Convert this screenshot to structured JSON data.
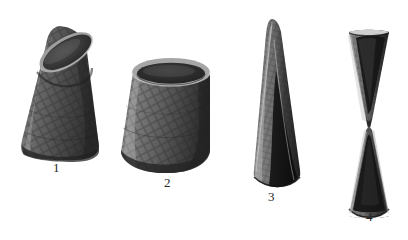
{
  "plate": {
    "title": "Conical woven vessels plate",
    "background_color": "#ffffff",
    "ink_color": "#262626",
    "medium": "halftone photographic plate",
    "object_count": 4
  },
  "labels": [
    {
      "id": "label-1",
      "text": "1",
      "x": 57,
      "y": 168
    },
    {
      "id": "label-2",
      "text": "2",
      "x": 168,
      "y": 183
    },
    {
      "id": "label-3",
      "text": "3",
      "x": 272,
      "y": 197
    },
    {
      "id": "label-4",
      "text": "4",
      "x": 370,
      "y": 217
    }
  ],
  "objects": [
    {
      "number": "1",
      "name": "truncated-cone-tilted",
      "description": "Wide truncated cone tilted left, open elliptical mouth at top, woven cross-hatch surface",
      "fill": "#5a5a5a",
      "shadow": "#2e2e2e",
      "highlight": "#9a9a9a",
      "mouth_fill": "#3a3a3a"
    },
    {
      "number": "2",
      "name": "truncated-cone-upright",
      "description": "Shorter, broader truncated cone upright with dark open mouth and thick rim",
      "fill": "#5f5f5f",
      "shadow": "#303030",
      "highlight": "#a2a2a2",
      "mouth_fill": "#2b2b2b"
    },
    {
      "number": "3",
      "name": "tall-pointed-cone",
      "description": "Tall slender pointed cone, dark hollow interior visible at lower right, concave base edge",
      "fill": "#6b6b6b",
      "shadow": "#1c1c1c",
      "highlight": "#adadad",
      "mouth_fill": "#161616"
    },
    {
      "number": "4",
      "name": "hourglass-double-cone",
      "description": "Hourglass of two cones meeting at narrow waist, both halves hollow with dark interiors",
      "fill": "#6e6e6e",
      "shadow": "#1a1a1a",
      "highlight": "#b4b4b4",
      "mouth_fill": "#141414"
    }
  ]
}
